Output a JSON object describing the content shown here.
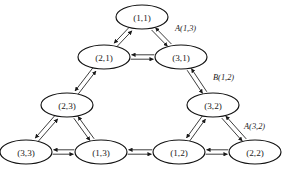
{
  "diagram": {
    "type": "directed-graph",
    "canvas": {
      "width": 283,
      "height": 175
    },
    "style": {
      "background": "#ffffff",
      "node_fill": "#ffffff",
      "node_stroke": "#111111",
      "edge_stroke": "#1a1a1a",
      "label_color": "#1a1a1a"
    },
    "node_size": {
      "rx": 26,
      "ry": 12
    },
    "nodes": [
      {
        "id": "n11",
        "label": "(1,1)",
        "x": 142,
        "y": 17
      },
      {
        "id": "n21",
        "label": "(2,1)",
        "x": 104,
        "y": 57
      },
      {
        "id": "n31",
        "label": "(3,1)",
        "x": 181,
        "y": 57
      },
      {
        "id": "n23",
        "label": "(2,3)",
        "x": 67,
        "y": 105
      },
      {
        "id": "n32",
        "label": "(3,2)",
        "x": 213,
        "y": 105
      },
      {
        "id": "n33",
        "label": "(3,3)",
        "x": 26,
        "y": 152
      },
      {
        "id": "n13",
        "label": "(1,3)",
        "x": 101,
        "y": 152
      },
      {
        "id": "n12",
        "label": "(1,2)",
        "x": 179,
        "y": 152
      },
      {
        "id": "n22",
        "label": "(2,2)",
        "x": 255,
        "y": 152
      }
    ],
    "edges": [
      {
        "from": "n21",
        "to": "n11",
        "bidirectional": true
      },
      {
        "from": "n31",
        "to": "n11",
        "bidirectional": true
      },
      {
        "from": "n21",
        "to": "n31",
        "bidirectional": true
      },
      {
        "from": "n23",
        "to": "n21",
        "bidirectional": true
      },
      {
        "from": "n32",
        "to": "n31",
        "bidirectional": true
      },
      {
        "from": "n33",
        "to": "n23",
        "bidirectional": true
      },
      {
        "from": "n13",
        "to": "n23",
        "bidirectional": true
      },
      {
        "from": "n33",
        "to": "n13",
        "bidirectional": true
      },
      {
        "from": "n12",
        "to": "n32",
        "bidirectional": true
      },
      {
        "from": "n22",
        "to": "n32",
        "bidirectional": true
      },
      {
        "from": "n13",
        "to": "n12",
        "bidirectional": true
      },
      {
        "from": "n12",
        "to": "n22",
        "bidirectional": true
      }
    ],
    "edge_labels": [
      {
        "id": "lbl-a13",
        "text": "A(1,3)",
        "x": 175,
        "y": 28,
        "edge": "n31-n11"
      },
      {
        "id": "lbl-b12",
        "text": "B(1,2)",
        "x": 213,
        "y": 77,
        "edge": "n32-n31"
      },
      {
        "id": "lbl-a32",
        "text": "A(3,2)",
        "x": 244,
        "y": 126,
        "edge": "n22-n32"
      }
    ]
  }
}
